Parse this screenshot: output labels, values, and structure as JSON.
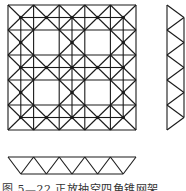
{
  "figure": {
    "caption": "图 5—22  正放抽空四角锥网架",
    "stroke_color": "#1a1a1a",
    "plan": {
      "x0": 8,
      "y0": 5,
      "cell_w": 25.6,
      "cell_h": 25,
      "cols": 5,
      "rows": 5,
      "hollow_cells": [
        [
          1,
          1
        ],
        [
          3,
          1
        ],
        [
          1,
          3
        ],
        [
          3,
          3
        ]
      ]
    },
    "side_profile": {
      "x_left": 167,
      "x_right": 184,
      "y0": 5,
      "step": 25,
      "panels": 5
    },
    "bottom_profile": {
      "y_top": 157,
      "y_bottom": 174,
      "x0": 8,
      "step": 25.6,
      "panels": 5
    }
  }
}
